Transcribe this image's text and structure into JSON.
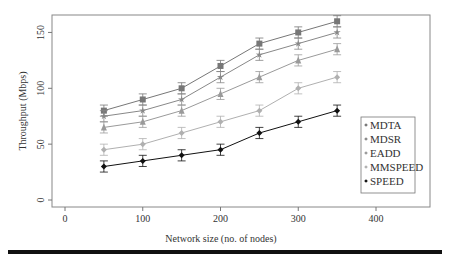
{
  "chart_data": {
    "type": "line",
    "title": "",
    "xlabel": "Network size (no. of nodes)",
    "ylabel": "Throughput (Mbps)",
    "xlim": [
      -15,
      465
    ],
    "ylim": [
      -12,
      168
    ],
    "xticks": [
      0,
      100,
      200,
      300,
      400
    ],
    "yticks": [
      0,
      50,
      100,
      150
    ],
    "grid": false,
    "legend_position": "right-middle",
    "error_bars": true,
    "x": [
      50,
      100,
      150,
      200,
      250,
      300,
      350
    ],
    "series": [
      {
        "name": "MDTA",
        "marker": "square",
        "color": "#777777",
        "values": [
          80,
          90,
          100,
          120,
          140,
          150,
          160
        ],
        "error": 5
      },
      {
        "name": "MDSR",
        "marker": "star",
        "color": "#888888",
        "values": [
          75,
          80,
          90,
          110,
          130,
          140,
          150
        ],
        "error": 5
      },
      {
        "name": "EADD",
        "marker": "triangle",
        "color": "#9a9a9a",
        "values": [
          65,
          70,
          80,
          95,
          110,
          125,
          135
        ],
        "error": 5
      },
      {
        "name": "MMSPEED",
        "marker": "diamond",
        "color": "#b0b0b0",
        "values": [
          45,
          50,
          60,
          70,
          80,
          100,
          110
        ],
        "error": 5
      },
      {
        "name": "SPEED",
        "marker": "diamond",
        "color": "#111111",
        "values": [
          30,
          35,
          40,
          45,
          60,
          70,
          80
        ],
        "error": 5
      }
    ]
  }
}
